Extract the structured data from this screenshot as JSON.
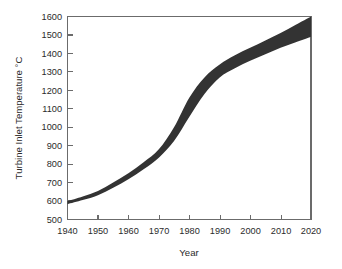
{
  "chart_data": {
    "type": "area",
    "title": "",
    "xlabel": "Year",
    "ylabel": "Turbine Inlet Temperature °C",
    "xlim": [
      1940,
      2020
    ],
    "ylim": [
      500,
      1600
    ],
    "xticks": [
      1940,
      1950,
      1960,
      1970,
      1980,
      1990,
      2000,
      2010,
      2020
    ],
    "yticks": [
      500,
      600,
      700,
      800,
      900,
      1000,
      1100,
      1200,
      1300,
      1400,
      1500,
      1600
    ],
    "grid": false,
    "legend": "none",
    "band_color": "#333333",
    "frame_color": "#6b6b6b",
    "background": "#ffffff",
    "x": [
      1940,
      1945,
      1950,
      1955,
      1960,
      1965,
      1970,
      1975,
      1980,
      1985,
      1990,
      1995,
      2000,
      2005,
      2010,
      2015,
      2020
    ],
    "series": [
      {
        "name": "Upper bound",
        "values": [
          600,
          625,
          655,
          700,
          750,
          810,
          880,
          1000,
          1160,
          1270,
          1340,
          1390,
          1430,
          1470,
          1510,
          1555,
          1600
        ]
      },
      {
        "name": "Lower bound",
        "values": [
          583,
          605,
          632,
          672,
          718,
          772,
          835,
          925,
          1055,
          1180,
          1270,
          1320,
          1360,
          1395,
          1430,
          1460,
          1490
        ]
      }
    ],
    "annotations": []
  },
  "axis": {
    "x_title": "Year",
    "y_title": "Turbine Inlet Temperature °C",
    "x_tick_labels": [
      "1940",
      "1950",
      "1960",
      "1970",
      "1980",
      "1990",
      "2000",
      "2010",
      "2020"
    ],
    "y_tick_labels": [
      "500",
      "600",
      "700",
      "800",
      "900",
      "1000",
      "1100",
      "1200",
      "1300",
      "1400",
      "1500",
      "1600"
    ]
  }
}
